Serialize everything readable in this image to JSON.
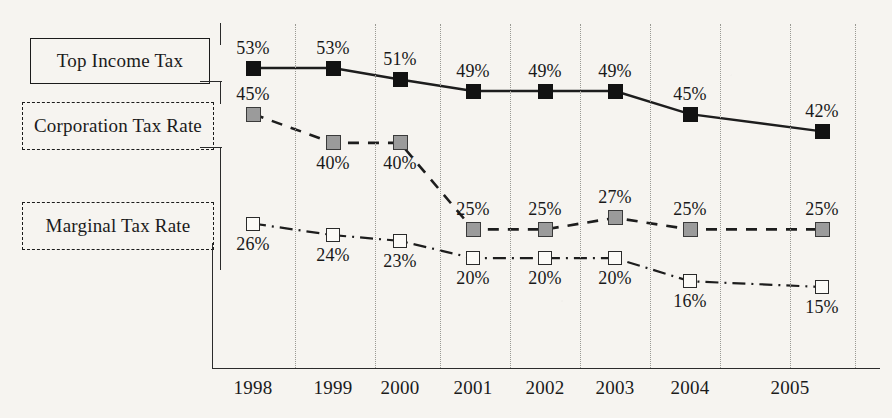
{
  "legend": {
    "items": [
      {
        "label": "Top Income Tax",
        "style": "solid"
      },
      {
        "label": "Corporation Tax Rate",
        "style": "dashed"
      },
      {
        "label": "Marginal Tax Rate",
        "style": "dashdot"
      }
    ]
  },
  "colors": {
    "background": "#f6f4f0",
    "ink": "#1b1b1b",
    "grid": "#9a9a94",
    "marker_filled": "#121212",
    "marker_grey": "#9b9b9b",
    "marker_hollow": "#fbfaf7"
  },
  "chart_data": {
    "type": "line",
    "title": "",
    "xlabel": "",
    "ylabel": "",
    "grid": true,
    "legend_position": "left",
    "categories": [
      "1998",
      "1999",
      "2000",
      "2001",
      "2002",
      "2003",
      "2004",
      "2005"
    ],
    "ylim": [
      0,
      60
    ],
    "value_suffix": "%",
    "series": [
      {
        "name": "Top Income Tax",
        "style": "solid",
        "marker": "filled-square",
        "values": [
          53,
          53,
          51,
          49,
          49,
          49,
          45,
          42
        ],
        "labels": [
          "53%",
          "53%",
          "51%",
          "49%",
          "49%",
          "49%",
          "45%",
          "42%"
        ]
      },
      {
        "name": "Corporation Tax Rate",
        "style": "dashed",
        "marker": "grey-square",
        "values": [
          45,
          40,
          40,
          25,
          25,
          27,
          25,
          25
        ],
        "labels": [
          "45%",
          "40%",
          "40%",
          "25%",
          "25%",
          "27%",
          "25%",
          "25%"
        ]
      },
      {
        "name": "Marginal Tax Rate",
        "style": "dash-dot",
        "marker": "hollow-square",
        "values": [
          26,
          24,
          23,
          20,
          20,
          20,
          16,
          15
        ],
        "labels": [
          "26%",
          "24%",
          "23%",
          "20%",
          "20%",
          "20%",
          "16%",
          "15%"
        ]
      }
    ]
  }
}
